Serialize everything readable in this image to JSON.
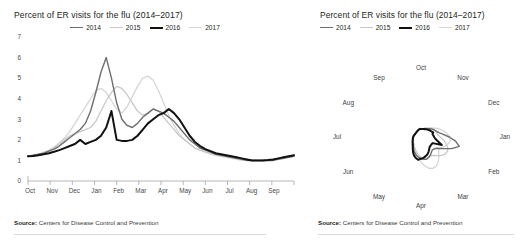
{
  "colors": {
    "s2014": "#6e6e6e",
    "s2015": "#c9c9c9",
    "s2016": "#111111",
    "s2017": "#d6d6d6",
    "axis": "#9a9a9a",
    "text": "#231f20",
    "rule": "#d8d8d8"
  },
  "left_panel": {
    "title": "Percent of ER visits for the flu (2014–2017)",
    "source_label": "Source:",
    "source_text": "Centers for Disease Control and Prevention",
    "legend": [
      {
        "label": "2014",
        "color": "#6e6e6e",
        "width": 1.6
      },
      {
        "label": "2015",
        "color": "#c9c9c9",
        "width": 1.4
      },
      {
        "label": "2016",
        "color": "#111111",
        "width": 2.2
      },
      {
        "label": "2017",
        "color": "#d6d6d6",
        "width": 1.4
      }
    ]
  },
  "right_panel": {
    "title": "Percent of ER visits for the flu (2014–2017)",
    "source_label": "Source:",
    "source_text": "Centers for Disease Control and Prevention",
    "legend": [
      {
        "label": "2014",
        "color": "#6e6e6e",
        "width": 1.6
      },
      {
        "label": "2015",
        "color": "#c9c9c9",
        "width": 1.4
      },
      {
        "label": "2016",
        "color": "#111111",
        "width": 2.2
      },
      {
        "label": "2017",
        "color": "#d6d6d6",
        "width": 1.4
      }
    ]
  },
  "chart_data": [
    {
      "type": "line",
      "id": "cartesian",
      "title": "Percent of ER visits for the flu (2014–2017)",
      "xlabel": "",
      "ylabel": "",
      "grid": false,
      "legend_position": "top-center",
      "ylim": [
        0,
        7
      ],
      "yticks": [
        0,
        1,
        2,
        3,
        4,
        5,
        6,
        7
      ],
      "categories": [
        "Oct",
        "Nov",
        "Dec",
        "Jan",
        "Feb",
        "Mar",
        "Apr",
        "May",
        "Jun",
        "Jul",
        "Aug",
        "Sep"
      ],
      "x": [
        0,
        1,
        2,
        3,
        4,
        5,
        6,
        7,
        8,
        9,
        10,
        11,
        12,
        13,
        14,
        15,
        16,
        17,
        18,
        19,
        20,
        21,
        22,
        23,
        24,
        25,
        26,
        27,
        28,
        29,
        30,
        31,
        32,
        33,
        34,
        35,
        36,
        37,
        38,
        39,
        40,
        41,
        42,
        43,
        44,
        45,
        46,
        47,
        48,
        49,
        50,
        51
      ],
      "series": [
        {
          "name": "2014",
          "color": "#6e6e6e",
          "width": 1.4,
          "values": [
            1.2,
            1.25,
            1.3,
            1.35,
            1.45,
            1.55,
            1.7,
            1.9,
            2.1,
            2.3,
            2.5,
            2.8,
            3.4,
            4.3,
            5.3,
            6.0,
            5.0,
            3.8,
            3.0,
            2.7,
            2.6,
            2.8,
            3.1,
            3.3,
            3.5,
            3.4,
            3.3,
            3.1,
            2.9,
            2.6,
            2.3,
            2.0,
            1.8,
            1.6,
            1.5,
            1.4,
            1.3,
            1.25,
            1.2,
            1.15,
            1.1,
            1.05,
            1.0,
            1.0,
            1.0,
            1.0,
            1.0,
            1.0,
            1.05,
            1.1,
            1.15,
            1.2
          ]
        },
        {
          "name": "2015",
          "color": "#c9c9c9",
          "width": 1.3,
          "values": [
            1.2,
            1.22,
            1.28,
            1.35,
            1.45,
            1.6,
            1.8,
            2.0,
            2.2,
            2.3,
            2.4,
            2.5,
            2.6,
            2.9,
            3.4,
            3.9,
            4.3,
            4.6,
            4.5,
            4.2,
            3.8,
            3.4,
            3.2,
            3.3,
            3.5,
            3.4,
            3.1,
            2.8,
            2.5,
            2.2,
            2.0,
            1.8,
            1.6,
            1.5,
            1.4,
            1.35,
            1.3,
            1.25,
            1.2,
            1.15,
            1.1,
            1.05,
            1.0,
            1.0,
            1.0,
            1.0,
            1.0,
            1.05,
            1.1,
            1.15,
            1.2,
            1.25
          ]
        },
        {
          "name": "2016",
          "color": "#111111",
          "width": 2.0,
          "values": [
            1.2,
            1.22,
            1.25,
            1.3,
            1.35,
            1.42,
            1.5,
            1.6,
            1.7,
            1.8,
            2.0,
            1.8,
            1.9,
            2.0,
            2.2,
            2.6,
            3.4,
            2.0,
            1.95,
            1.95,
            2.0,
            2.2,
            2.5,
            2.8,
            3.0,
            3.2,
            3.3,
            3.5,
            3.3,
            3.0,
            2.6,
            2.2,
            1.9,
            1.7,
            1.55,
            1.45,
            1.35,
            1.3,
            1.25,
            1.2,
            1.15,
            1.1,
            1.05,
            1.0,
            1.0,
            1.0,
            1.02,
            1.05,
            1.1,
            1.15,
            1.2,
            1.25
          ]
        },
        {
          "name": "2017",
          "color": "#d6d6d6",
          "width": 1.3,
          "values": [
            1.2,
            1.25,
            1.3,
            1.4,
            1.5,
            1.65,
            1.85,
            2.1,
            2.4,
            2.8,
            3.2,
            3.6,
            4.0,
            4.4,
            4.5,
            4.3,
            3.9,
            3.5,
            3.3,
            3.6,
            4.1,
            4.6,
            5.0,
            5.1,
            4.9,
            4.4,
            3.8,
            3.2,
            2.7,
            2.3,
            2.0,
            1.8,
            1.6,
            1.5,
            1.4,
            1.3,
            1.25,
            1.2,
            1.15,
            1.1,
            1.05,
            1.0,
            1.0,
            1.0,
            1.0,
            1.0,
            1.0,
            1.05,
            1.1,
            1.15,
            1.2,
            1.25
          ]
        }
      ]
    },
    {
      "type": "line",
      "id": "polar",
      "title": "Percent of ER visits for the flu (2014–2017)",
      "coordinate_system": "polar",
      "grid": false,
      "legend_position": "top-left",
      "rlim": [
        0,
        7
      ],
      "month_labels": [
        "Oct",
        "Nov",
        "Dec",
        "Jan",
        "Feb",
        "Mar",
        "Apr",
        "May",
        "Jun",
        "Jul",
        "Aug",
        "Sep"
      ],
      "angle_start_deg": -90,
      "direction": "clockwise",
      "series": [
        {
          "name": "2014",
          "color": "#6e6e6e",
          "width": 1.4,
          "values": [
            1.2,
            1.25,
            1.3,
            1.35,
            1.45,
            1.55,
            1.7,
            1.9,
            2.1,
            2.3,
            2.5,
            2.8,
            3.4,
            4.3,
            5.3,
            6.0,
            5.0,
            3.8,
            3.0,
            2.7,
            2.6,
            2.8,
            3.1,
            3.3,
            3.5,
            3.4,
            3.3,
            3.1,
            2.9,
            2.6,
            2.3,
            2.0,
            1.8,
            1.6,
            1.5,
            1.4,
            1.3,
            1.25,
            1.2,
            1.15,
            1.1,
            1.05,
            1.0,
            1.0,
            1.0,
            1.0,
            1.0,
            1.0,
            1.05,
            1.1,
            1.15,
            1.2
          ]
        },
        {
          "name": "2015",
          "color": "#c9c9c9",
          "width": 1.3,
          "values": [
            1.2,
            1.22,
            1.28,
            1.35,
            1.45,
            1.6,
            1.8,
            2.0,
            2.2,
            2.3,
            2.4,
            2.5,
            2.6,
            2.9,
            3.4,
            3.9,
            4.3,
            4.6,
            4.5,
            4.2,
            3.8,
            3.4,
            3.2,
            3.3,
            3.5,
            3.4,
            3.1,
            2.8,
            2.5,
            2.2,
            2.0,
            1.8,
            1.6,
            1.5,
            1.4,
            1.35,
            1.3,
            1.25,
            1.2,
            1.15,
            1.1,
            1.05,
            1.0,
            1.0,
            1.0,
            1.0,
            1.0,
            1.05,
            1.1,
            1.15,
            1.2,
            1.25
          ]
        },
        {
          "name": "2016",
          "color": "#111111",
          "width": 2.0,
          "values": [
            1.2,
            1.22,
            1.25,
            1.3,
            1.35,
            1.42,
            1.5,
            1.6,
            1.7,
            1.8,
            2.0,
            1.8,
            1.9,
            2.0,
            2.2,
            2.6,
            3.4,
            2.0,
            1.95,
            1.95,
            2.0,
            2.2,
            2.5,
            2.8,
            3.0,
            3.2,
            3.3,
            3.5,
            3.3,
            3.0,
            2.6,
            2.2,
            1.9,
            1.7,
            1.55,
            1.45,
            1.35,
            1.3,
            1.25,
            1.2,
            1.15,
            1.1,
            1.05,
            1.0,
            1.0,
            1.0,
            1.02,
            1.05,
            1.1,
            1.15,
            1.2,
            1.25
          ]
        },
        {
          "name": "2017",
          "color": "#d6d6d6",
          "width": 1.3,
          "values": [
            1.2,
            1.25,
            1.3,
            1.4,
            1.5,
            1.65,
            1.85,
            2.1,
            2.4,
            2.8,
            3.2,
            3.6,
            4.0,
            4.4,
            4.5,
            4.3,
            3.9,
            3.5,
            3.3,
            3.6,
            4.1,
            4.6,
            5.0,
            5.1,
            4.9,
            4.4,
            3.8,
            3.2,
            2.7,
            2.3,
            2.0,
            1.8,
            1.6,
            1.5,
            1.4,
            1.3,
            1.25,
            1.2,
            1.15,
            1.1,
            1.05,
            1.0,
            1.0,
            1.0,
            1.0,
            1.0,
            1.0,
            1.05,
            1.1,
            1.15,
            1.2,
            1.25
          ]
        }
      ]
    }
  ]
}
